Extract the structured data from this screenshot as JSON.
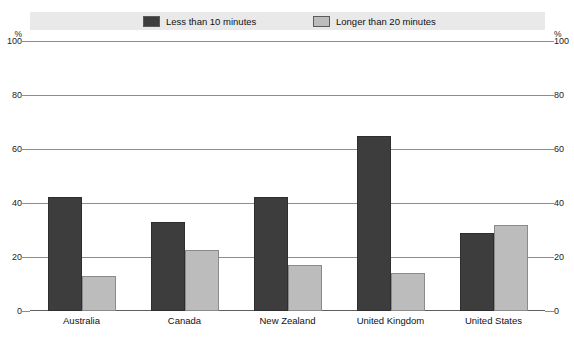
{
  "chart_data": {
    "type": "bar",
    "title": "",
    "subtitle": "",
    "xlabel": "",
    "ylabel": "%",
    "ylabel_right": "%",
    "ylim": [
      0,
      100
    ],
    "yticks": [
      0,
      20,
      40,
      60,
      80,
      100
    ],
    "grid": true,
    "legend_position": "top",
    "categories": [
      "Australia",
      "Canada",
      "New Zealand",
      "United Kingdom",
      "United States"
    ],
    "series": [
      {
        "name": "Less than 10 minutes",
        "color": "#3d3d3d",
        "values": [
          42.5,
          33,
          42.5,
          65,
          29
        ]
      },
      {
        "name": "Longer than 20 minutes",
        "color": "#bcbcbc",
        "values": [
          13,
          22.5,
          17,
          14,
          32
        ]
      }
    ]
  },
  "axis": {
    "unit_left": "%",
    "unit_right": "%",
    "ticks": [
      "100",
      "80",
      "60",
      "40",
      "20",
      "0"
    ]
  },
  "legend": {
    "items": [
      {
        "label": "Less than 10 minutes"
      },
      {
        "label": "Longer than 20 minutes"
      }
    ]
  }
}
